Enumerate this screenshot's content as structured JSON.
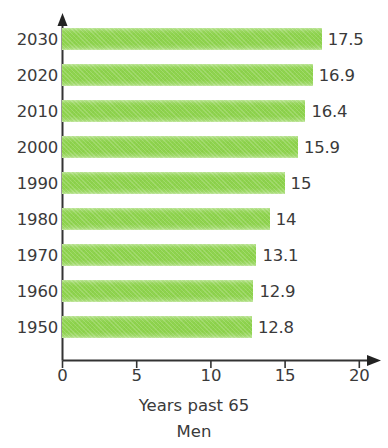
{
  "chart_data": {
    "type": "bar",
    "orientation": "horizontal",
    "title": "",
    "xlabel": "Years past 65",
    "ylabel": "",
    "subtitle": "Men",
    "categories": [
      "2030",
      "2020",
      "2010",
      "2000",
      "1990",
      "1980",
      "1970",
      "1960",
      "1950"
    ],
    "values": [
      17.5,
      16.9,
      16.4,
      15.9,
      15,
      14,
      13.1,
      12.9,
      12.8
    ],
    "value_labels": [
      "17.5",
      "16.9",
      "16.4",
      "15.9",
      "15",
      "14",
      "13.1",
      "12.9",
      "12.8"
    ],
    "xlim": [
      0,
      20
    ],
    "xticks": [
      0,
      5,
      10,
      15,
      20
    ],
    "xtick_labels": [
      "0",
      "5",
      "10",
      "15",
      "20"
    ],
    "grid": false,
    "legend": false,
    "bar_color": "#8ed34e",
    "text_color": "#3a3a3a",
    "axis_color": "#333333"
  },
  "axis": {
    "x_arrow": "arrow-right-icon",
    "y_arrow": "arrow-up-icon"
  }
}
